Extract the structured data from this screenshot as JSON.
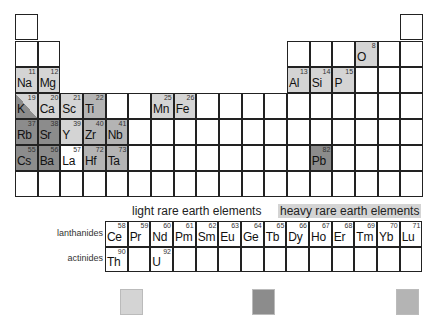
{
  "title_labels": {
    "light_ree": "light rare earth elements",
    "heavy_ree": "heavy rare earth elements",
    "lanthanides": "lanthanides",
    "actinides": "actinides"
  },
  "colors": {
    "common": "#d4d4d4",
    "lile": "#8c8c8c",
    "hfs": "#b4b4b4",
    "empty": "#ffffff"
  },
  "grid": {
    "origin_x": 15,
    "origin_y": 14,
    "cell_w": 22.67,
    "row_tops": [
      14,
      41,
      67,
      93,
      119,
      145,
      171
    ],
    "cell_h": 26
  },
  "main_table": {
    "empty_cells": [
      [
        1,
        1
      ],
      [
        1,
        18
      ],
      [
        2,
        1
      ],
      [
        2,
        2
      ],
      [
        2,
        13
      ],
      [
        2,
        14
      ],
      [
        2,
        15
      ],
      [
        2,
        17
      ],
      [
        2,
        18
      ],
      [
        3,
        16
      ],
      [
        3,
        17
      ],
      [
        3,
        18
      ],
      [
        4,
        5
      ],
      [
        4,
        6
      ],
      [
        4,
        9
      ],
      [
        4,
        10
      ],
      [
        4,
        11
      ],
      [
        4,
        12
      ],
      [
        4,
        13
      ],
      [
        4,
        14
      ],
      [
        4,
        15
      ],
      [
        4,
        16
      ],
      [
        4,
        17
      ],
      [
        4,
        18
      ],
      [
        5,
        6
      ],
      [
        5,
        7
      ],
      [
        5,
        8
      ],
      [
        5,
        9
      ],
      [
        5,
        10
      ],
      [
        5,
        11
      ],
      [
        5,
        12
      ],
      [
        5,
        13
      ],
      [
        5,
        14
      ],
      [
        5,
        15
      ],
      [
        5,
        16
      ],
      [
        5,
        17
      ],
      [
        5,
        18
      ],
      [
        6,
        6
      ],
      [
        6,
        7
      ],
      [
        6,
        8
      ],
      [
        6,
        9
      ],
      [
        6,
        10
      ],
      [
        6,
        11
      ],
      [
        6,
        12
      ],
      [
        6,
        13
      ],
      [
        6,
        15
      ],
      [
        6,
        16
      ],
      [
        6,
        17
      ],
      [
        6,
        18
      ],
      [
        7,
        1
      ],
      [
        7,
        2
      ],
      [
        7,
        3
      ],
      [
        7,
        4
      ],
      [
        7,
        5
      ],
      [
        7,
        6
      ],
      [
        7,
        7
      ],
      [
        7,
        8
      ],
      [
        7,
        9
      ],
      [
        7,
        10
      ],
      [
        7,
        11
      ],
      [
        7,
        12
      ],
      [
        7,
        13
      ],
      [
        7,
        14
      ],
      [
        7,
        15
      ],
      [
        7,
        16
      ],
      [
        7,
        17
      ],
      [
        7,
        18
      ]
    ],
    "elements": [
      {
        "sym": "O",
        "num": "8",
        "row": 2,
        "col": 16,
        "cat": "common"
      },
      {
        "sym": "Na",
        "num": "11",
        "row": 3,
        "col": 1,
        "cat": "common"
      },
      {
        "sym": "Mg",
        "num": "12",
        "row": 3,
        "col": 2,
        "cat": "common"
      },
      {
        "sym": "Al",
        "num": "13",
        "row": 3,
        "col": 13,
        "cat": "common"
      },
      {
        "sym": "Si",
        "num": "14",
        "row": 3,
        "col": 14,
        "cat": "common"
      },
      {
        "sym": "P",
        "num": "15",
        "row": 3,
        "col": 15,
        "cat": "common"
      },
      {
        "sym": "K",
        "num": "19",
        "row": 4,
        "col": 1,
        "cat": "split"
      },
      {
        "sym": "Ca",
        "num": "20",
        "row": 4,
        "col": 2,
        "cat": "common"
      },
      {
        "sym": "Sc",
        "num": "21",
        "row": 4,
        "col": 3,
        "cat": "common"
      },
      {
        "sym": "Ti",
        "num": "22",
        "row": 4,
        "col": 4,
        "cat": "hfs"
      },
      {
        "sym": "Mn",
        "num": "25",
        "row": 4,
        "col": 7,
        "cat": "common"
      },
      {
        "sym": "Fe",
        "num": "26",
        "row": 4,
        "col": 8,
        "cat": "common"
      },
      {
        "sym": "Rb",
        "num": "37",
        "row": 5,
        "col": 1,
        "cat": "lile"
      },
      {
        "sym": "Sr",
        "num": "38",
        "row": 5,
        "col": 2,
        "cat": "lile"
      },
      {
        "sym": "Y",
        "num": "39",
        "row": 5,
        "col": 3,
        "cat": "common"
      },
      {
        "sym": "Zr",
        "num": "40",
        "row": 5,
        "col": 4,
        "cat": "hfs"
      },
      {
        "sym": "Nb",
        "num": "41",
        "row": 5,
        "col": 5,
        "cat": "hfs"
      },
      {
        "sym": "Cs",
        "num": "55",
        "row": 6,
        "col": 1,
        "cat": "lile"
      },
      {
        "sym": "Ba",
        "num": "56",
        "row": 6,
        "col": 2,
        "cat": "lile"
      },
      {
        "sym": "La",
        "num": "57",
        "row": 6,
        "col": 3,
        "cat": "empty"
      },
      {
        "sym": "Hf",
        "num": "72",
        "row": 6,
        "col": 4,
        "cat": "hfs"
      },
      {
        "sym": "Ta",
        "num": "73",
        "row": 6,
        "col": 5,
        "cat": "hfs"
      },
      {
        "sym": "Pb",
        "num": "82",
        "row": 6,
        "col": 14,
        "cat": "lile"
      }
    ]
  },
  "f_block": {
    "origin_x": 105,
    "row_tops": [
      221,
      246.5
    ],
    "lanthanides": [
      {
        "sym": "Ce",
        "num": "58",
        "cat": "empty"
      },
      {
        "sym": "Pr",
        "num": "59",
        "cat": "empty"
      },
      {
        "sym": "Nd",
        "num": "60",
        "cat": "empty"
      },
      {
        "sym": "Pm",
        "num": "61",
        "cat": "empty"
      },
      {
        "sym": "Sm",
        "num": "62",
        "cat": "empty"
      },
      {
        "sym": "Eu",
        "num": "63",
        "cat": "empty"
      },
      {
        "sym": "Ge",
        "num": "64",
        "cat": "empty"
      },
      {
        "sym": "Tb",
        "num": "65",
        "cat": "common"
      },
      {
        "sym": "Dy",
        "num": "66",
        "cat": "common"
      },
      {
        "sym": "Ho",
        "num": "67",
        "cat": "common"
      },
      {
        "sym": "Er",
        "num": "68",
        "cat": "common"
      },
      {
        "sym": "Tm",
        "num": "69",
        "cat": "common"
      },
      {
        "sym": "Yb",
        "num": "70",
        "cat": "common"
      },
      {
        "sym": "Lu",
        "num": "71",
        "cat": "common"
      }
    ],
    "actinides": [
      {
        "sym": "Th",
        "num": "90",
        "cat": "lile"
      },
      {
        "sym": "",
        "num": "",
        "cat": "empty"
      },
      {
        "sym": "U",
        "num": "92",
        "cat": "lile"
      },
      {
        "sym": "",
        "num": "",
        "cat": "empty"
      },
      {
        "sym": "",
        "num": "",
        "cat": "empty"
      },
      {
        "sym": "",
        "num": "",
        "cat": "empty"
      },
      {
        "sym": "",
        "num": "",
        "cat": "empty"
      },
      {
        "sym": "",
        "num": "",
        "cat": "empty"
      },
      {
        "sym": "",
        "num": "",
        "cat": "empty"
      },
      {
        "sym": "",
        "num": "",
        "cat": "empty"
      },
      {
        "sym": "",
        "num": "",
        "cat": "empty"
      },
      {
        "sym": "",
        "num": "",
        "cat": "empty"
      },
      {
        "sym": "",
        "num": "",
        "cat": "empty"
      },
      {
        "sym": "",
        "num": "",
        "cat": "empty"
      }
    ]
  },
  "legend": [
    {
      "line1": "common major and minor",
      "line2": "elements",
      "cat": "common"
    },
    {
      "line1": "light ion lithophile",
      "line2": "elements",
      "cat": "lile"
    },
    {
      "line1": "high field strength",
      "line2": "elements",
      "cat": "hfs"
    }
  ]
}
